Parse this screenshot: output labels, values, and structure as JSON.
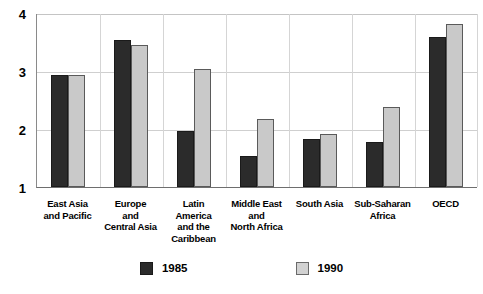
{
  "chart_data": {
    "type": "bar",
    "title": "",
    "xlabel": "",
    "ylabel": "",
    "ylim": [
      1,
      4
    ],
    "yticks": [
      "1",
      "2",
      "3",
      "4"
    ],
    "grid": true,
    "legend_position": "bottom",
    "categories": [
      "East Asia\nand Pacific",
      "Europe\nand\nCentral Asia",
      "Latin\nAmerica\nand the\nCaribbean",
      "Middle East\nand\nNorth Africa",
      "South Asia",
      "Sub-Saharan\nAfrica",
      "OECD"
    ],
    "series": [
      {
        "name": "1985",
        "color": "#2b2b2b",
        "values": [
          2.93,
          3.53,
          1.97,
          1.53,
          1.83,
          1.77,
          3.59
        ]
      },
      {
        "name": "1990",
        "color": "#c9c9c9",
        "values": [
          2.93,
          3.45,
          3.03,
          2.17,
          1.91,
          2.38,
          3.81
        ]
      }
    ]
  },
  "legend": {
    "items": [
      {
        "label": "1985"
      },
      {
        "label": "1990"
      }
    ]
  }
}
